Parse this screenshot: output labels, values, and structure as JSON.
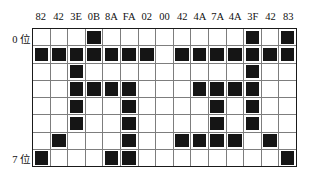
{
  "figure": {
    "name": "bit-pattern-grid",
    "grid_colors": {
      "filled": "#151515",
      "empty": "#ffffff",
      "grid_line": "#7d7d7d",
      "border": "#1a1a1a"
    }
  },
  "axis": {
    "row_first_label": "0 位",
    "row_last_label": "7 位"
  },
  "columns": [
    {
      "hex": "82"
    },
    {
      "hex": "42"
    },
    {
      "hex": "3E"
    },
    {
      "hex": "0B"
    },
    {
      "hex": "8A"
    },
    {
      "hex": "FA"
    },
    {
      "hex": "02"
    },
    {
      "hex": "00"
    },
    {
      "hex": "42"
    },
    {
      "hex": "4A"
    },
    {
      "hex": "7A"
    },
    {
      "hex": "4A"
    },
    {
      "hex": "3F"
    },
    {
      "hex": "42"
    },
    {
      "hex": "83"
    }
  ],
  "chart_data": {
    "type": "heatmap",
    "title": "",
    "xlabel": "",
    "ylabel": "",
    "grid": true,
    "legend": "none",
    "x_tick_labels": [
      "82",
      "42",
      "3E",
      "0B",
      "8A",
      "FA",
      "02",
      "00",
      "42",
      "4A",
      "7A",
      "4A",
      "3F",
      "42",
      "83"
    ],
    "y_tick_labels": [
      "0 位",
      "",
      "",
      "",
      "",
      "",
      "",
      "7 位"
    ],
    "rows": 8,
    "cols": 15,
    "values": [
      [
        0,
        0,
        0,
        1,
        0,
        0,
        0,
        0,
        0,
        0,
        0,
        0,
        1,
        0,
        1
      ],
      [
        1,
        1,
        1,
        1,
        1,
        1,
        1,
        0,
        1,
        1,
        1,
        1,
        1,
        1,
        1
      ],
      [
        0,
        0,
        1,
        0,
        0,
        0,
        0,
        0,
        0,
        0,
        0,
        0,
        1,
        0,
        0
      ],
      [
        0,
        0,
        1,
        1,
        1,
        1,
        0,
        0,
        0,
        1,
        1,
        1,
        1,
        0,
        0
      ],
      [
        0,
        0,
        1,
        0,
        0,
        1,
        0,
        0,
        0,
        0,
        1,
        0,
        1,
        0,
        0
      ],
      [
        0,
        0,
        1,
        0,
        0,
        1,
        0,
        0,
        0,
        0,
        1,
        0,
        1,
        0,
        0
      ],
      [
        0,
        1,
        0,
        0,
        0,
        1,
        0,
        0,
        1,
        1,
        1,
        1,
        0,
        1,
        0
      ],
      [
        1,
        0,
        0,
        0,
        1,
        1,
        0,
        0,
        0,
        0,
        0,
        0,
        0,
        0,
        1
      ]
    ]
  }
}
